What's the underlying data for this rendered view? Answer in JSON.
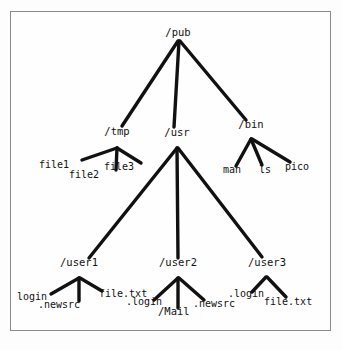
{
  "diagram": {
    "background": "#fdfdfd",
    "border_color": "#8a8a8a",
    "line_color": "#111111",
    "text_color": "#111111",
    "nodes": [
      {
        "id": "pub",
        "label": "/pub",
        "kind": "directory",
        "x": 178,
        "y": 36,
        "anchor": "middle"
      },
      {
        "id": "tmp",
        "label": "/tmp",
        "kind": "directory",
        "x": 117,
        "y": 135,
        "anchor": "middle"
      },
      {
        "id": "usr",
        "label": "/usr",
        "kind": "directory",
        "x": 177,
        "y": 136,
        "anchor": "middle"
      },
      {
        "id": "bin",
        "label": "/bin",
        "kind": "directory",
        "x": 251,
        "y": 128,
        "anchor": "middle"
      },
      {
        "id": "file1",
        "label": "file1",
        "kind": "file",
        "x": 39,
        "y": 168,
        "anchor": "start"
      },
      {
        "id": "file2",
        "label": "file2",
        "kind": "file",
        "x": 69,
        "y": 178,
        "anchor": "start"
      },
      {
        "id": "file3",
        "label": "file3",
        "kind": "file",
        "x": 104,
        "y": 170,
        "anchor": "start"
      },
      {
        "id": "man",
        "label": "man",
        "kind": "file",
        "x": 223,
        "y": 173,
        "anchor": "start"
      },
      {
        "id": "ls",
        "label": "ls",
        "kind": "file",
        "x": 259,
        "y": 173,
        "anchor": "start"
      },
      {
        "id": "pico",
        "label": "pico",
        "kind": "file",
        "x": 285,
        "y": 170,
        "anchor": "start"
      },
      {
        "id": "user1",
        "label": "/user1",
        "kind": "directory",
        "x": 79,
        "y": 266,
        "anchor": "middle"
      },
      {
        "id": "user2",
        "label": "/user2",
        "kind": "directory",
        "x": 178,
        "y": 266,
        "anchor": "middle"
      },
      {
        "id": "user3",
        "label": "/user3",
        "kind": "directory",
        "x": 267,
        "y": 266,
        "anchor": "middle"
      },
      {
        "id": "u1login",
        "label": "login",
        "kind": "file",
        "x": 17,
        "y": 300,
        "anchor": "start"
      },
      {
        "id": "u1news",
        "label": ".newsrc",
        "kind": "file",
        "x": 38,
        "y": 308,
        "anchor": "start"
      },
      {
        "id": "u1file",
        "label": "file.txt",
        "kind": "file",
        "x": 99,
        "y": 297,
        "anchor": "start"
      },
      {
        "id": "u2login",
        "label": ".login",
        "kind": "file",
        "x": 126,
        "y": 305,
        "anchor": "start"
      },
      {
        "id": "u2mail",
        "label": "/Mail",
        "kind": "directory",
        "x": 158,
        "y": 315,
        "anchor": "start"
      },
      {
        "id": "u2news",
        "label": ".newsrc",
        "kind": "file",
        "x": 193,
        "y": 307,
        "anchor": "start"
      },
      {
        "id": "u3login",
        "label": ".login",
        "kind": "file",
        "x": 228,
        "y": 297,
        "anchor": "start"
      },
      {
        "id": "u3file",
        "label": "file.txt",
        "kind": "file",
        "x": 264,
        "y": 305,
        "anchor": "start"
      }
    ],
    "edges": [
      {
        "from": "pub",
        "to": "tmp",
        "x1": 178,
        "y1": 41,
        "x2": 122,
        "y2": 126,
        "width": 3.4
      },
      {
        "from": "pub",
        "to": "usr",
        "x1": 179,
        "y1": 41,
        "x2": 174,
        "y2": 127,
        "width": 3.4
      },
      {
        "from": "pub",
        "to": "bin",
        "x1": 180,
        "y1": 41,
        "x2": 246,
        "y2": 120,
        "width": 3.4
      },
      {
        "from": "tmp",
        "to": "file1",
        "x1": 117,
        "y1": 148,
        "x2": 82,
        "y2": 160,
        "width": 3.4
      },
      {
        "from": "tmp",
        "to": "file2",
        "x1": 117,
        "y1": 148,
        "x2": 116,
        "y2": 170,
        "width": 3.4
      },
      {
        "from": "tmp",
        "to": "file3",
        "x1": 117,
        "y1": 148,
        "x2": 141,
        "y2": 163,
        "width": 3.4
      },
      {
        "from": "bin",
        "to": "man",
        "x1": 251,
        "y1": 139,
        "x2": 236,
        "y2": 166,
        "width": 3.4
      },
      {
        "from": "bin",
        "to": "ls",
        "x1": 251,
        "y1": 139,
        "x2": 262,
        "y2": 165,
        "width": 3.4
      },
      {
        "from": "bin",
        "to": "pico",
        "x1": 252,
        "y1": 139,
        "x2": 290,
        "y2": 162,
        "width": 3.4
      },
      {
        "from": "usr",
        "to": "user1",
        "x1": 177,
        "y1": 148,
        "x2": 89,
        "y2": 258,
        "width": 3.4
      },
      {
        "from": "usr",
        "to": "user2",
        "x1": 177,
        "y1": 148,
        "x2": 178,
        "y2": 258,
        "width": 3.4
      },
      {
        "from": "usr",
        "to": "user3",
        "x1": 178,
        "y1": 148,
        "x2": 262,
        "y2": 257,
        "width": 3.4
      },
      {
        "from": "user1",
        "to": "u1login",
        "x1": 79,
        "y1": 278,
        "x2": 51,
        "y2": 294,
        "width": 3.4
      },
      {
        "from": "user1",
        "to": "u1news",
        "x1": 79,
        "y1": 278,
        "x2": 79,
        "y2": 301,
        "width": 3.4
      },
      {
        "from": "user1",
        "to": "u1file",
        "x1": 80,
        "y1": 278,
        "x2": 102,
        "y2": 291,
        "width": 3.4
      },
      {
        "from": "user2",
        "to": "u2login",
        "x1": 178,
        "y1": 278,
        "x2": 154,
        "y2": 300,
        "width": 3.4
      },
      {
        "from": "user2",
        "to": "u2mail",
        "x1": 178,
        "y1": 278,
        "x2": 178,
        "y2": 308,
        "width": 3.4
      },
      {
        "from": "user2",
        "to": "u2news",
        "x1": 179,
        "y1": 278,
        "x2": 204,
        "y2": 300,
        "width": 3.4
      },
      {
        "from": "user3",
        "to": "u3login",
        "x1": 266,
        "y1": 277,
        "x2": 252,
        "y2": 292,
        "width": 3.4
      },
      {
        "from": "user3",
        "to": "u3file",
        "x1": 267,
        "y1": 277,
        "x2": 286,
        "y2": 297,
        "width": 3.4
      }
    ]
  }
}
